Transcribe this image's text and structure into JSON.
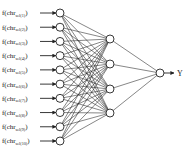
{
  "diagram": {
    "type": "neural-network",
    "inputs": [
      {
        "prefix": "f(chr",
        "sub": "sel(1)",
        "suffix": ")"
      },
      {
        "prefix": "f(chr",
        "sub": "sel(2)",
        "suffix": ")"
      },
      {
        "prefix": "f(chr",
        "sub": "sel(3)",
        "suffix": ")"
      },
      {
        "prefix": "f(chr",
        "sub": "sel(4)",
        "suffix": ")"
      },
      {
        "prefix": "f(chr",
        "sub": "sel(5)",
        "suffix": ")"
      },
      {
        "prefix": "f(chr",
        "sub": "sel(6)",
        "suffix": ")"
      },
      {
        "prefix": "f(chr",
        "sub": "sel(7)",
        "suffix": ")"
      },
      {
        "prefix": "f(chr",
        "sub": "sel(8)",
        "suffix": ")"
      },
      {
        "prefix": "f(chr",
        "sub": "sel(9)",
        "suffix": ")"
      },
      {
        "prefix": "f(chr",
        "sub": "sel(10)",
        "suffix": ")"
      }
    ],
    "layers": {
      "input_nodes": 10,
      "hidden_nodes": 4,
      "output_nodes": 1
    },
    "output_label": "Y",
    "colors": {
      "stroke": "#222222",
      "background": "#ffffff"
    }
  }
}
